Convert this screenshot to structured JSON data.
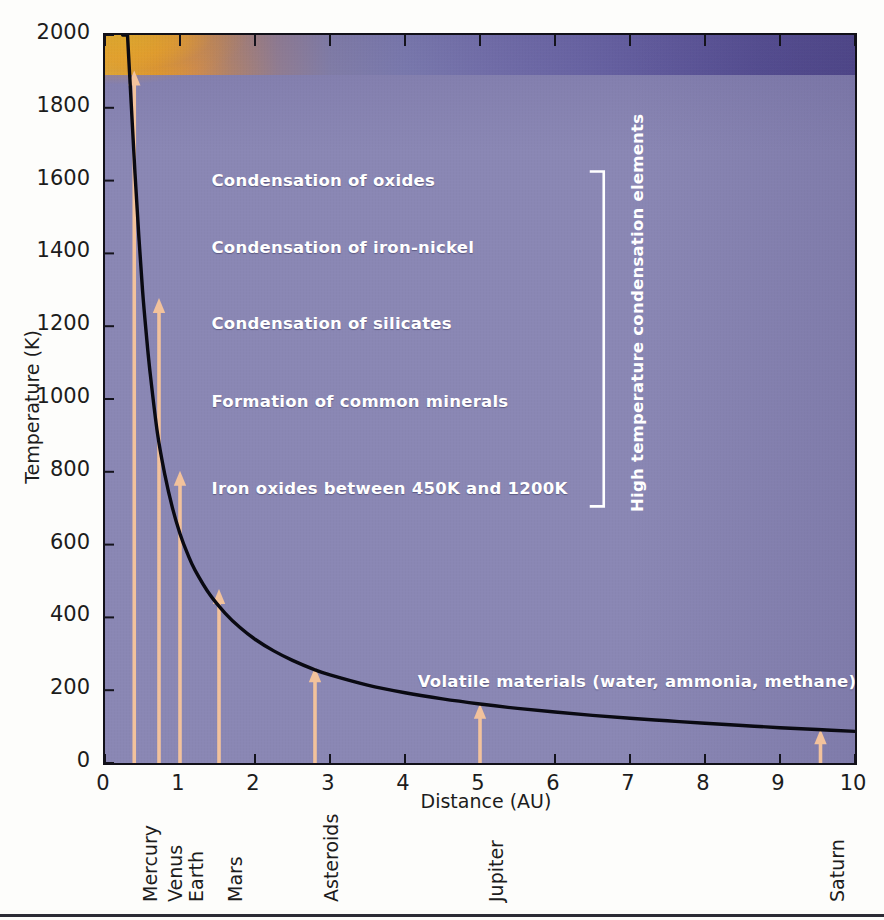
{
  "chart_data": {
    "type": "line",
    "title": "",
    "xlabel": "Distance (AU)",
    "ylabel": "Temperature (K)",
    "xlim": [
      0,
      10
    ],
    "ylim": [
      0,
      2000
    ],
    "xticks": [
      0,
      1,
      2,
      3,
      4,
      5,
      6,
      7,
      8,
      9,
      10
    ],
    "yticks": [
      0,
      200,
      400,
      600,
      800,
      1000,
      1200,
      1400,
      1600,
      1800,
      2000
    ],
    "xtick_labels": [
      "0",
      "1",
      "2",
      "3",
      "4",
      "5",
      "6",
      "7",
      "8",
      "9",
      "10"
    ],
    "ytick_labels": [
      "0",
      "200",
      "400",
      "600",
      "800",
      "1000",
      "1200",
      "1400",
      "1600",
      "1800",
      "2000"
    ],
    "grid": false,
    "legend": "none",
    "series": [
      {
        "name": "Solar nebula temperature",
        "color": "#0a0a12",
        "x": [
          0.3,
          0.35,
          0.4,
          0.45,
          0.5,
          0.55,
          0.6,
          0.7,
          0.8,
          0.9,
          1.0,
          1.1,
          1.2,
          1.4,
          1.6,
          1.8,
          2.0,
          2.25,
          2.5,
          2.8,
          3.0,
          3.5,
          4.0,
          4.5,
          5.0,
          5.5,
          6.0,
          6.5,
          7.0,
          7.5,
          8.0,
          8.5,
          9.0,
          9.5,
          10.0
        ],
        "y": [
          2000,
          1810,
          1620,
          1450,
          1300,
          1180,
          1075,
          905,
          790,
          700,
          630,
          575,
          530,
          462,
          412,
          372,
          340,
          308,
          282,
          256,
          242,
          214,
          193,
          176,
          162,
          150,
          140,
          131,
          123,
          116,
          109,
          103,
          97,
          92,
          87
        ]
      }
    ],
    "nebula_band": {
      "description": "hot inner nebula glow fading outward",
      "inner_color": "#ffc01f",
      "outer_color": "#4c4489",
      "background_color": "#8a87b4"
    },
    "annotations": [
      {
        "text": "Condensation of oxides",
        "x": 1.42,
        "y": 1600
      },
      {
        "text": "Condensation of iron-nickel",
        "x": 1.42,
        "y": 1415
      },
      {
        "text": "Condensation of silicates",
        "x": 1.42,
        "y": 1205
      },
      {
        "text": "Formation of common minerals",
        "x": 1.42,
        "y": 992
      },
      {
        "text": "Iron oxides between 450K and 1200K",
        "x": 1.42,
        "y": 752
      },
      {
        "text": "Volatile materials (water, ammonia, methane)",
        "x": 4.17,
        "y": 222
      }
    ],
    "bracket": {
      "label": "High temperature condensation elements",
      "x": 6.65,
      "y_top": 1625,
      "y_bottom": 705,
      "color": "#ffffff"
    },
    "markers": [
      {
        "label": "Mercury",
        "x": 0.39,
        "y_tip": 1900,
        "color": "#f2c29c"
      },
      {
        "label": "Venus",
        "x": 0.72,
        "y_tip": 1275,
        "color": "#f2c29c"
      },
      {
        "label": "Earth",
        "x": 1.0,
        "y_tip": 800,
        "color": "#f2c29c"
      },
      {
        "label": "Mars",
        "x": 1.52,
        "y_tip": 475,
        "color": "#f2c29c"
      },
      {
        "label": "Asteroids",
        "x": 2.8,
        "y_tip": 260,
        "color": "#f2c29c"
      },
      {
        "label": "Jupiter",
        "x": 5.0,
        "y_tip": 160,
        "color": "#f2c29c"
      },
      {
        "label": "Saturn",
        "x": 9.54,
        "y_tip": 90,
        "color": "#f2c29c"
      }
    ]
  },
  "axes": {
    "x_title": "Distance (AU)",
    "y_title": "Temperature (K)"
  }
}
